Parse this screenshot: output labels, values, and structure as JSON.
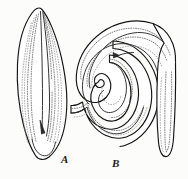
{
  "plate": {
    "kind": "scientific-line-illustration",
    "subject": "flatworm-two-body-postures",
    "background_color": "#fcfcfb",
    "ink_color": "#141414",
    "stipple_color": "#5c5c5c",
    "width_px": 188,
    "height_px": 179
  },
  "figures": [
    {
      "id": "A",
      "label": "A",
      "description": "elongate lancet-shaped worm, extended posture, pointed anterior at top, rounded posterior at bottom, tilted slightly right",
      "bounds": {
        "x": 14,
        "y": 8,
        "width": 56,
        "height": 152
      },
      "label_position": {
        "x": 61,
        "y": 154
      }
    },
    {
      "id": "B",
      "label": "B",
      "description": "same worm in coiled serpentine posture, body looping into a spiral with free rounded tip at lower right",
      "bounds": {
        "x": 74,
        "y": 20,
        "width": 104,
        "height": 140
      },
      "label_position": {
        "x": 112,
        "y": 158
      }
    }
  ],
  "details": {
    "organ_marker_label": "pharynx-marking",
    "internal_lines": "longitudinal stippled body-wall lines"
  }
}
